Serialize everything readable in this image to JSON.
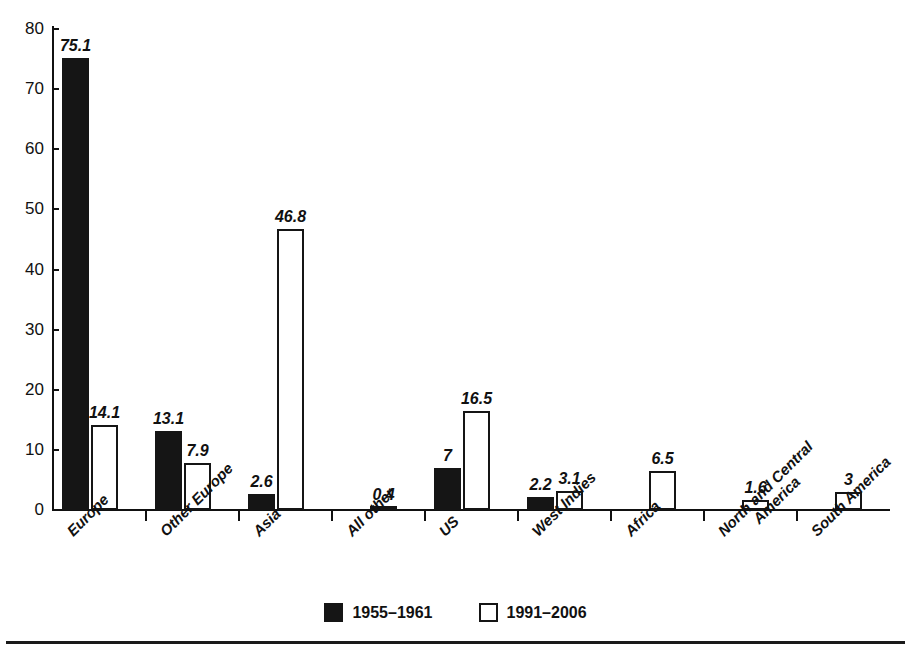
{
  "chart_data": {
    "type": "bar",
    "title": "",
    "subtitle": "",
    "xlabel": "",
    "ylabel": "",
    "ylim": [
      0,
      80
    ],
    "ytick_step": 10,
    "ytick_labels": [
      "0",
      "10",
      "20",
      "30",
      "40",
      "50",
      "60",
      "70",
      "80"
    ],
    "grid": false,
    "legend_position": "bottom-center",
    "categories": [
      "Europe",
      "Other Europe",
      "Asia",
      "All other",
      "US",
      "West Indies",
      "Africa",
      "North and Central America",
      "South America"
    ],
    "category_lines": [
      [
        "Europe"
      ],
      [
        "Other Europe"
      ],
      [
        "Asia"
      ],
      [
        "All other"
      ],
      [
        "US"
      ],
      [
        "West Indies"
      ],
      [
        "Africa"
      ],
      [
        "North and Central",
        "America"
      ],
      [
        "South America"
      ]
    ],
    "series": [
      {
        "name": "1955–1961",
        "color": "#151515",
        "fill": "solid",
        "values": [
          75.1,
          13.1,
          2.6,
          null,
          7,
          2.2,
          null,
          null,
          null
        ],
        "labels": [
          "75.1",
          "13.1",
          "2.6",
          "",
          "7",
          "2.2",
          "",
          "",
          ""
        ]
      },
      {
        "name": "1991–2006",
        "color": "#ffffff",
        "fill": "outline",
        "values": [
          14.1,
          7.9,
          46.8,
          0.4,
          16.5,
          3.1,
          6.5,
          1.6,
          3
        ],
        "labels": [
          "14.1",
          "7.9",
          "46.8",
          "0.4",
          "16.5",
          "3.1",
          "6.5",
          "1.6",
          "3"
        ]
      }
    ]
  },
  "legend": {
    "items": [
      {
        "label": "1955–1961",
        "swatch": "black"
      },
      {
        "label": "1991–2006",
        "swatch": "white"
      }
    ]
  },
  "colors": {
    "series_1955_1961": "#151515",
    "series_1991_2006": "#ffffff",
    "axis": "#111111",
    "background": "#ffffff"
  }
}
